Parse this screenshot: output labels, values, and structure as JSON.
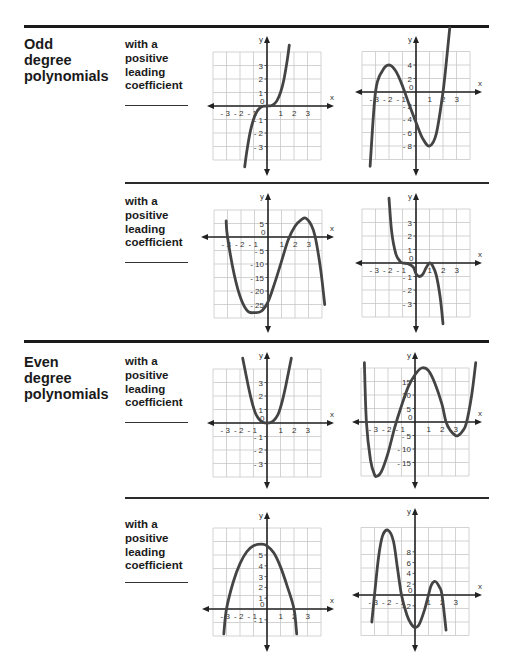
{
  "sections": [
    {
      "title": "Odd\ndegree\npolynomials",
      "rows": [
        {
          "description": "with a\npositive\nleading\ncoefficient"
        },
        {
          "description": "with a\npositive\nleading\ncoefficient"
        }
      ]
    },
    {
      "title": "Even\ndegree\npolynomials",
      "rows": [
        {
          "description": "with a\npositive\nleading\ncoefficient"
        },
        {
          "description": "with a\npositive\nleading\ncoefficient"
        }
      ]
    }
  ],
  "axis_labels": {
    "x": "x",
    "y": "y"
  },
  "colors": {
    "curve": "#444444",
    "grid": "#c8c8c8",
    "axis": "#222222",
    "rule": "#1a1a1a"
  },
  "chart_data": [
    {
      "type": "line",
      "id": "odd-1",
      "title": "Odd degree, graph A",
      "xlabel": "x",
      "ylabel": "y",
      "x_ticks": [
        "-3",
        "-2",
        "-1",
        "0",
        "1",
        "2",
        "3"
      ],
      "y_ticks": [
        "3",
        "2",
        "1",
        "-1",
        "-2",
        "-3"
      ],
      "xlim": [
        -4,
        4
      ],
      "ylim": [
        -4,
        4
      ],
      "grid": true,
      "description": "y = x^3 (cubic through origin)",
      "x": [
        -1.65,
        -1.5,
        -1.25,
        -1,
        -0.75,
        -0.5,
        -0.25,
        0,
        0.25,
        0.5,
        0.75,
        1,
        1.25,
        1.5,
        1.65
      ],
      "y": [
        -4.5,
        -3.4,
        -1.95,
        -1,
        -0.42,
        -0.125,
        -0.016,
        0,
        0.016,
        0.125,
        0.42,
        1,
        1.95,
        3.4,
        4.5
      ]
    },
    {
      "type": "line",
      "id": "odd-2",
      "title": "Odd degree, graph B",
      "xlabel": "x",
      "ylabel": "y",
      "x_ticks": [
        "-3",
        "-2",
        "-1",
        "0",
        "1",
        "2",
        "3"
      ],
      "y_ticks": [
        "4",
        "2",
        "-2",
        "-4",
        "-6",
        "-8"
      ],
      "xlim": [
        -4,
        4
      ],
      "ylim": [
        -10,
        6
      ],
      "grid": true,
      "description": "cubic with roots near -3, -0.5, 2; local max 4 at x=-2, local min -8 at x=1",
      "x": [
        -3.4,
        -3,
        -2.5,
        -2,
        -1.5,
        -1,
        -0.5,
        0,
        0.5,
        1,
        1.5,
        2,
        2.3,
        2.5
      ],
      "y": [
        -11,
        0,
        3.1,
        4,
        3.1,
        0.9,
        -1.9,
        -4.5,
        -6.9,
        -8,
        -6.2,
        0,
        5.5,
        9.5
      ]
    },
    {
      "type": "line",
      "id": "odd-3",
      "title": "Odd degree, graph C",
      "xlabel": "x",
      "ylabel": "y",
      "x_ticks": [
        "-3",
        "-2",
        "-1",
        "0",
        "1",
        "2",
        "3"
      ],
      "y_ticks": [
        "5",
        "-5",
        "-10",
        "-15",
        "-20",
        "-25"
      ],
      "xlim": [
        -4,
        4
      ],
      "ylim": [
        -30,
        10
      ],
      "grid": true,
      "description": "cubic (negative end behavior) with roots near -3, 1.5, 3.5; min about -28 at x=-1; max about 6 at x=2.8",
      "x": [
        -3.1,
        -3,
        -2.5,
        -2,
        -1.5,
        -1,
        -0.5,
        0,
        0.5,
        1,
        1.5,
        2,
        2.5,
        2.8,
        3.2,
        3.5,
        3.9,
        4.2
      ],
      "y": [
        6,
        0,
        -14,
        -23,
        -27.5,
        -28,
        -27.5,
        -24,
        -17,
        -9,
        -1,
        4,
        6.5,
        7,
        4.5,
        0,
        -12,
        -25
      ]
    },
    {
      "type": "line",
      "id": "odd-4",
      "title": "Odd degree, graph D",
      "xlabel": "x",
      "ylabel": "y",
      "x_ticks": [
        "-3",
        "-2",
        "-1",
        "0",
        "1",
        "2",
        "3"
      ],
      "y_ticks": [
        "3",
        "2",
        "1",
        "-1",
        "-2",
        "-3"
      ],
      "xlim": [
        -4,
        4
      ],
      "ylim": [
        -4,
        4
      ],
      "grid": true,
      "description": "quintic-like curve falling from upper left, flattening near x=-1, local min about -1 near x=0.25, touching x-axis at x=1, then falling steeply",
      "x": [
        -2,
        -1.8,
        -1.5,
        -1.2,
        -1,
        -0.6,
        -0.2,
        0,
        0.25,
        0.5,
        0.75,
        1,
        1.2,
        1.5,
        1.8,
        2
      ],
      "y": [
        4.8,
        2.3,
        0.7,
        0.15,
        0,
        -0.05,
        -0.3,
        -0.8,
        -1,
        -0.85,
        -0.35,
        0,
        -0.15,
        -0.9,
        -2.6,
        -4.5
      ]
    },
    {
      "type": "line",
      "id": "even-1",
      "title": "Even degree, graph A",
      "xlabel": "x",
      "ylabel": "y",
      "x_ticks": [
        "-3",
        "-2",
        "-1",
        "0",
        "1",
        "2",
        "3"
      ],
      "y_ticks": [
        "3",
        "2",
        "1",
        "-1",
        "-2",
        "-3"
      ],
      "xlim": [
        -4,
        4
      ],
      "ylim": [
        -4,
        4
      ],
      "grid": true,
      "description": "y = x^4 style curve with minimum at origin",
      "x": [
        -1.8,
        -1.6,
        -1.4,
        -1.2,
        -1,
        -0.8,
        -0.5,
        -0.25,
        0,
        0.25,
        0.5,
        0.8,
        1,
        1.2,
        1.4,
        1.6,
        1.8
      ],
      "y": [
        4.8,
        3.8,
        2.8,
        1.9,
        1.15,
        0.6,
        0.18,
        0.03,
        0,
        0.03,
        0.18,
        0.6,
        1.15,
        1.9,
        2.8,
        3.8,
        4.8
      ]
    },
    {
      "type": "line",
      "id": "even-2",
      "title": "Even degree, graph B",
      "xlabel": "x",
      "ylabel": "y",
      "x_ticks": [
        "-3",
        "-2",
        "-1",
        "0",
        "1",
        "2",
        "3"
      ],
      "y_ticks": [
        "15",
        "10",
        "5",
        "-5",
        "-10",
        "-15"
      ],
      "xlim": [
        -4,
        4
      ],
      "ylim": [
        -20,
        20
      ],
      "grid": true,
      "description": "quartic with roots near -3.6, -1.4, 2.3, 3.9; min about -20 at x=-2.8; max about 20 at x=0.5; min about -5 at x=3.2",
      "x": [
        -3.75,
        -3.6,
        -3.3,
        -3,
        -2.8,
        -2.5,
        -2,
        -1.5,
        -1,
        -0.5,
        0,
        0.5,
        1,
        1.5,
        2,
        2.3,
        2.6,
        3,
        3.2,
        3.5,
        3.8,
        4.2,
        4.5
      ],
      "y": [
        22,
        0,
        -14,
        -19.5,
        -20,
        -18.5,
        -11.5,
        -2,
        6,
        13,
        17.5,
        20,
        19,
        14,
        6.5,
        0,
        -3,
        -5,
        -5,
        -3.5,
        -0.5,
        10,
        22
      ]
    },
    {
      "type": "line",
      "id": "even-3",
      "title": "Even degree, graph C",
      "xlabel": "x",
      "ylabel": "y",
      "x_ticks": [
        "-3",
        "-2",
        "-1",
        "0",
        "1",
        "2",
        "3"
      ],
      "y_ticks": [
        "5",
        "4",
        "3",
        "2",
        "1",
        "-1"
      ],
      "xlim": [
        -4,
        4
      ],
      "ylim": [
        -3,
        7
      ],
      "grid": true,
      "description": "downward parabola with vertex near (-0.4, 6), roots near -3 and 2",
      "x": [
        -3.2,
        -3,
        -2.5,
        -2,
        -1.5,
        -1,
        -0.4,
        0,
        0.5,
        1,
        1.5,
        2,
        2.2
      ],
      "y": [
        -2.3,
        0,
        2.5,
        4.2,
        5.3,
        5.85,
        6,
        5.85,
        5.2,
        3.9,
        2.1,
        0,
        -2.3
      ]
    },
    {
      "type": "line",
      "id": "even-4",
      "title": "Even degree, graph D",
      "xlabel": "x",
      "ylabel": "y",
      "x_ticks": [
        "-3",
        "-2",
        "-1",
        "0",
        "1",
        "2",
        "3"
      ],
      "y_ticks": [
        "8",
        "6",
        "4",
        "2",
        "-2"
      ],
      "xlim": [
        -4,
        4
      ],
      "ylim": [
        -8,
        12
      ],
      "grid": true,
      "description": "quartic-like curve (opens downward) with roots near -3, -1, 1.1, 2; max about 12 at x=-2; min about -6 at x=0; local max about 2.5 at x=1.5",
      "x": [
        -3.2,
        -3,
        -2.7,
        -2.4,
        -2,
        -1.6,
        -1.3,
        -1,
        -0.6,
        -0.3,
        0,
        0.3,
        0.7,
        1,
        1.2,
        1.5,
        1.8,
        2,
        2.3
      ],
      "y": [
        -5,
        0,
        7,
        11,
        12,
        10,
        5,
        0,
        -3.7,
        -5.3,
        -6,
        -5.5,
        -2.8,
        0,
        1.8,
        2.5,
        1.5,
        0,
        -6.5
      ]
    }
  ]
}
